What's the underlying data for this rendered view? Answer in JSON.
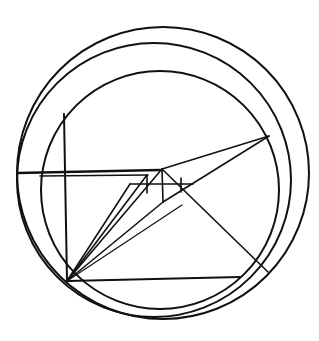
{
  "diagram": {
    "width": 319,
    "height": 341,
    "background": "#ffffff",
    "stroke_color": "#111111",
    "circles": [
      {
        "name": "outer-circle",
        "cx": 163,
        "cy": 173,
        "r": 146,
        "stroke_width": 2
      },
      {
        "name": "middle-circle",
        "cx": 154,
        "cy": 180,
        "r": 137,
        "stroke_width": 2
      },
      {
        "name": "inner-circle",
        "cx": 160,
        "cy": 190,
        "r": 119,
        "stroke_width": 2
      }
    ],
    "lines": [
      {
        "name": "vertical-axis-line",
        "x1": 64,
        "y1": 114,
        "x2": 67,
        "y2": 281,
        "w": 2
      },
      {
        "name": "upper-horizontal-line",
        "x1": 18,
        "y1": 173,
        "x2": 160,
        "y2": 170,
        "w": 2.4
      },
      {
        "name": "upper-horizontal-line-2",
        "x1": 40,
        "y1": 176,
        "x2": 148,
        "y2": 175,
        "w": 1.6
      },
      {
        "name": "lower-horizontal-line",
        "x1": 68,
        "y1": 281,
        "x2": 240,
        "y2": 277,
        "w": 2
      },
      {
        "name": "apex-to-right-point",
        "x1": 162,
        "y1": 169,
        "x2": 269,
        "y2": 136,
        "w": 1.6
      },
      {
        "name": "center-to-right-point",
        "x1": 163,
        "y1": 202,
        "x2": 269,
        "y2": 136,
        "w": 1.6
      },
      {
        "name": "apex-to-lower-right",
        "x1": 162,
        "y1": 169,
        "x2": 268,
        "y2": 272,
        "w": 1.6
      },
      {
        "name": "lower-left-to-apex",
        "x1": 67,
        "y1": 281,
        "x2": 162,
        "y2": 169,
        "w": 1.6
      },
      {
        "name": "lower-left-to-step-a",
        "x1": 67,
        "y1": 281,
        "x2": 147,
        "y2": 175,
        "w": 1.6
      },
      {
        "name": "lower-left-to-step-b",
        "x1": 67,
        "y1": 281,
        "x2": 130,
        "y2": 184,
        "w": 1.6
      },
      {
        "name": "lower-left-to-center",
        "x1": 67,
        "y1": 281,
        "x2": 163,
        "y2": 202,
        "w": 1.6
      },
      {
        "name": "lower-left-to-right-point",
        "x1": 67,
        "y1": 281,
        "x2": 182,
        "y2": 205,
        "w": 1.2
      },
      {
        "name": "step-horizontal",
        "x1": 130,
        "y1": 184,
        "x2": 193,
        "y2": 184,
        "w": 1.6
      },
      {
        "name": "apex-vertical",
        "x1": 162,
        "y1": 169,
        "x2": 163,
        "y2": 202,
        "w": 1.6
      },
      {
        "name": "tick-left",
        "x1": 147,
        "y1": 175,
        "x2": 147,
        "y2": 193,
        "w": 1.6
      },
      {
        "name": "tick-right",
        "x1": 181,
        "y1": 178,
        "x2": 181,
        "y2": 192,
        "w": 1.6
      },
      {
        "name": "left-arc-stub",
        "x1": 18,
        "y1": 173,
        "x2": 18,
        "y2": 173,
        "w": 0
      }
    ]
  }
}
